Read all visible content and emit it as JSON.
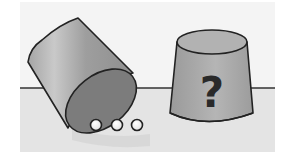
{
  "scene": {
    "description": "Illustration: tipped-over cup with three balls rolled out, and an upright cup hiding unknown contents",
    "colors": {
      "background": "#ffffff",
      "upper_panel": "#f3f3f3",
      "table_surface": "#e3e3e3",
      "table_edge": "#333333",
      "cup_body": "#9a9a9a",
      "cup_body_light": "#c4c4c4",
      "cup_opening": "#7a7a7a",
      "cup_top": "#b0b0b0",
      "outline": "#222222",
      "ball": "#ffffff",
      "shadow": "#d2d2d2"
    },
    "left_cup": {
      "state": "tipped-over",
      "balls_count": 3
    },
    "right_cup": {
      "state": "upright",
      "label": "?"
    }
  }
}
